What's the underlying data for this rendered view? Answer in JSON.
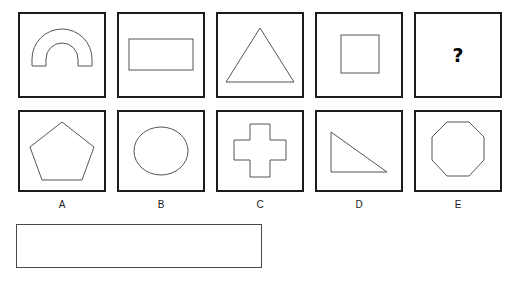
{
  "puzzle": {
    "type": "shape-analogy-multiple-choice",
    "prompt_row": {
      "name": "sequence-row",
      "cells": [
        {
          "id": "seq-1",
          "shape": "arch",
          "shape_label": "arch",
          "text": ""
        },
        {
          "id": "seq-2",
          "shape": "rectangle",
          "shape_label": "rectangle",
          "text": ""
        },
        {
          "id": "seq-3",
          "shape": "triangle",
          "shape_label": "triangle",
          "text": ""
        },
        {
          "id": "seq-4",
          "shape": "square",
          "shape_label": "square",
          "text": ""
        },
        {
          "id": "seq-5",
          "shape": "question",
          "shape_label": "question-mark",
          "text": "?"
        }
      ]
    },
    "options_row": {
      "name": "options-row",
      "cells": [
        {
          "id": "opt-a",
          "label": "A",
          "shape": "pentagon",
          "shape_label": "pentagon"
        },
        {
          "id": "opt-b",
          "label": "B",
          "shape": "ellipse",
          "shape_label": "circle"
        },
        {
          "id": "opt-c",
          "label": "C",
          "shape": "cross",
          "shape_label": "cross"
        },
        {
          "id": "opt-d",
          "label": "D",
          "shape": "right-triangle",
          "shape_label": "right-triangle"
        },
        {
          "id": "opt-e",
          "label": "E",
          "shape": "octagon",
          "shape_label": "octagon"
        }
      ]
    },
    "answer_field": {
      "value": "",
      "placeholder": ""
    }
  },
  "colors": {
    "cell_border": "#1c1c1c",
    "shape_stroke": "#555555",
    "answer_border": "#4a4a4a",
    "background": "#ffffff",
    "text": "#111111"
  }
}
